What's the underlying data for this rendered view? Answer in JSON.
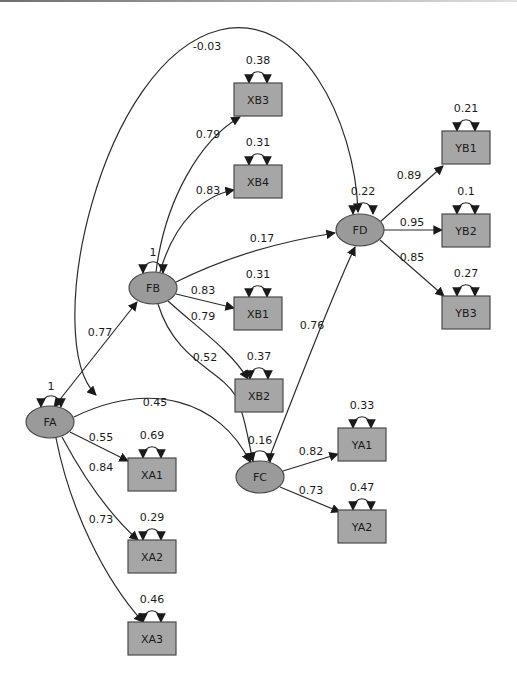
{
  "diagram": {
    "type": "structural-equation-model-path-diagram",
    "latent_factors": [
      {
        "id": "FA",
        "label": "FA",
        "variance": "1"
      },
      {
        "id": "FB",
        "label": "FB",
        "variance": "1"
      },
      {
        "id": "FC",
        "label": "FC",
        "variance": "0.16"
      },
      {
        "id": "FD",
        "label": "FD",
        "variance": "0.22"
      }
    ],
    "indicators": [
      {
        "id": "XB3",
        "label": "XB3",
        "error_variance": "0.38",
        "loading": "0.79",
        "factor": "FB"
      },
      {
        "id": "XB4",
        "label": "XB4",
        "error_variance": "0.31",
        "loading": "0.83",
        "factor": "FB"
      },
      {
        "id": "XB1",
        "label": "XB1",
        "error_variance": "0.31",
        "loading": "0.83",
        "factor": "FB"
      },
      {
        "id": "XB2",
        "label": "XB2",
        "error_variance": "0.37",
        "loading": "0.79",
        "factor": "FB"
      },
      {
        "id": "YB1",
        "label": "YB1",
        "error_variance": "0.21",
        "loading": "0.89",
        "factor": "FD"
      },
      {
        "id": "YB2",
        "label": "YB2",
        "error_variance": "0.1",
        "loading": "0.95",
        "factor": "FD"
      },
      {
        "id": "YB3",
        "label": "YB3",
        "error_variance": "0.27",
        "loading": "0.85",
        "factor": "FD"
      },
      {
        "id": "YA1",
        "label": "YA1",
        "error_variance": "0.33",
        "loading": "0.82",
        "factor": "FC"
      },
      {
        "id": "YA2",
        "label": "YA2",
        "error_variance": "0.47",
        "loading": "0.73",
        "factor": "FC"
      },
      {
        "id": "XA1",
        "label": "XA1",
        "error_variance": "0.69",
        "loading": "0.55",
        "factor": "FA"
      },
      {
        "id": "XA2",
        "label": "XA2",
        "error_variance": "0.29",
        "loading": "0.84",
        "factor": "FA"
      },
      {
        "id": "XA3",
        "label": "XA3",
        "error_variance": "0.46",
        "loading": "0.73",
        "factor": "FA"
      }
    ],
    "structural_paths": [
      {
        "from": "FA",
        "to": "FB",
        "coef": "0.77",
        "bidirectional": true
      },
      {
        "from": "FA",
        "to": "FD",
        "coef": "-0.03",
        "bidirectional": true
      },
      {
        "from": "FA",
        "to": "FC",
        "coef": "0.45"
      },
      {
        "from": "FB",
        "to": "FD",
        "coef": "0.17"
      },
      {
        "from": "FB",
        "to": "FC",
        "coef": "0.52"
      },
      {
        "from": "FC",
        "to": "FD",
        "coef": "0.76"
      }
    ]
  }
}
